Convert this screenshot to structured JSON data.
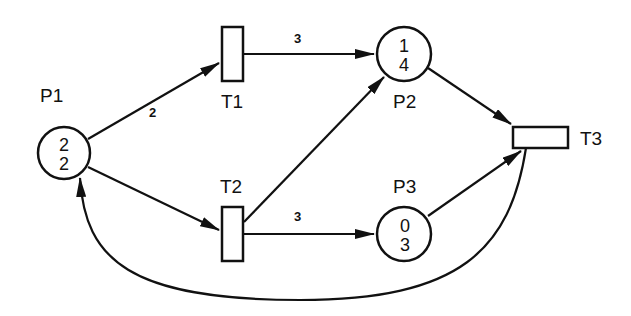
{
  "diagram": {
    "type": "petri-net",
    "places": [
      {
        "id": "P1",
        "label": "P1",
        "top": "2",
        "bottom": "2"
      },
      {
        "id": "P2",
        "label": "P2",
        "top": "1",
        "bottom": "4"
      },
      {
        "id": "P3",
        "label": "P3",
        "top": "0",
        "bottom": "3"
      }
    ],
    "transitions": [
      {
        "id": "T1",
        "label": "T1"
      },
      {
        "id": "T2",
        "label": "T2"
      },
      {
        "id": "T3",
        "label": "T3"
      }
    ],
    "arcs": [
      {
        "from": "P1",
        "to": "T1",
        "weight": "2"
      },
      {
        "from": "P1",
        "to": "T2",
        "weight": ""
      },
      {
        "from": "T1",
        "to": "P2",
        "weight": "3"
      },
      {
        "from": "T2",
        "to": "P2",
        "weight": ""
      },
      {
        "from": "T2",
        "to": "P3",
        "weight": "3"
      },
      {
        "from": "P2",
        "to": "T3",
        "weight": ""
      },
      {
        "from": "P3",
        "to": "T3",
        "weight": ""
      },
      {
        "from": "T3",
        "to": "P1",
        "weight": ""
      }
    ],
    "colors": {
      "stroke": "#111111",
      "background": "#ffffff"
    }
  }
}
